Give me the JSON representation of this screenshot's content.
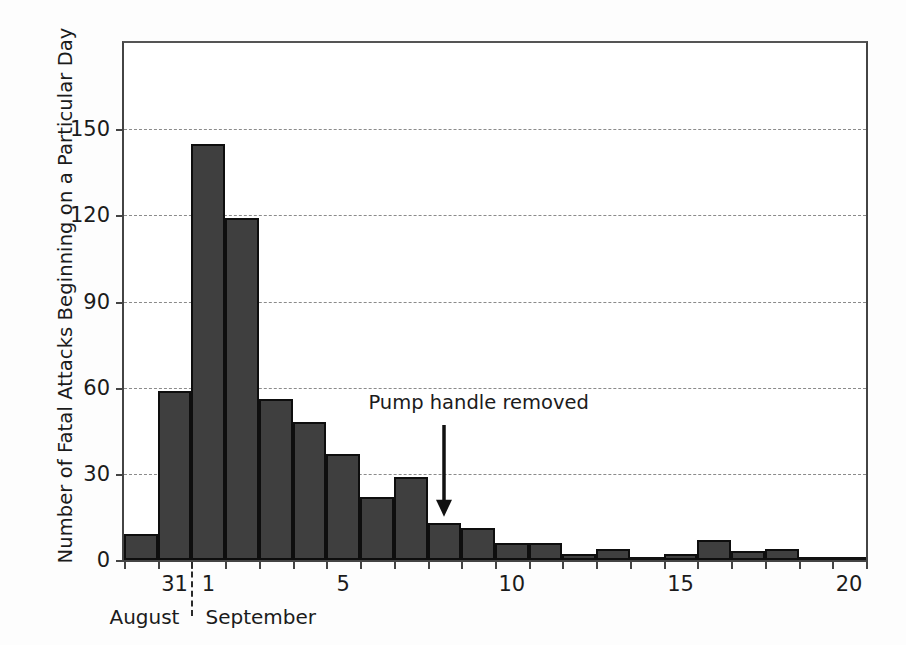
{
  "chart_data": {
    "type": "bar",
    "title": "",
    "xlabel": "",
    "ylabel": "Number of Fatal Attacks Beginning on a Particular Day",
    "ylim": [
      0,
      180
    ],
    "yticks": [
      0,
      30,
      60,
      90,
      120,
      150
    ],
    "ytick_labels": [
      "0",
      "30",
      "60",
      "90",
      "120",
      "150"
    ],
    "grid": true,
    "legend": null,
    "xtick_labels": [
      "31",
      "1",
      "5",
      "10",
      "15",
      "20"
    ],
    "x_group_labels": [
      "August",
      "September"
    ],
    "categories": [
      "Aug 30",
      "Aug 31",
      "Sep 1",
      "Sep 2",
      "Sep 3",
      "Sep 4",
      "Sep 5",
      "Sep 6",
      "Sep 7",
      "Sep 8",
      "Sep 9",
      "Sep 10",
      "Sep 11",
      "Sep 12",
      "Sep 13",
      "Sep 14",
      "Sep 15",
      "Sep 16",
      "Sep 17",
      "Sep 18",
      "Sep 19",
      "Sep 20"
    ],
    "values": [
      9,
      59,
      145,
      119,
      56,
      48,
      37,
      22,
      29,
      13,
      11,
      6,
      6,
      2,
      4,
      1,
      2,
      7,
      3,
      4,
      1,
      1
    ],
    "annotations": [
      {
        "text": "Pump handle removed",
        "points_to_category": "Sep 8",
        "arrow": "down"
      }
    ]
  },
  "colors": {
    "bar_fill": "#3f3f3f",
    "bar_edge": "#0e0e0e",
    "grid": "#8b8b8b",
    "axis": "#444444",
    "text": "#1b1b1b",
    "background": "#fdfdfd",
    "plot_background": "#ffffff"
  }
}
